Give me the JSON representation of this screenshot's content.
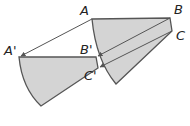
{
  "diagram": {
    "type": "geometric-translation",
    "colors": {
      "fill": "#d4d4d4",
      "stroke": "#555555",
      "arrow": "#555555",
      "label": "#222222"
    },
    "original_points": {
      "A": {
        "label": "A",
        "x": 92,
        "y": 19
      },
      "B": {
        "label": "B",
        "x": 170,
        "y": 18
      },
      "C": {
        "label": "C",
        "x": 172,
        "y": 31
      }
    },
    "image_points": {
      "A'": {
        "label": "A'",
        "x": 19,
        "y": 57
      },
      "B'": {
        "label": "B'",
        "x": 96,
        "y": 57
      },
      "C'": {
        "label": "C'",
        "x": 98,
        "y": 68
      }
    },
    "labels": {
      "a": "A",
      "b": "B",
      "c": "C",
      "a_prime": "A'",
      "b_prime": "B'",
      "c_prime": "C'"
    }
  }
}
